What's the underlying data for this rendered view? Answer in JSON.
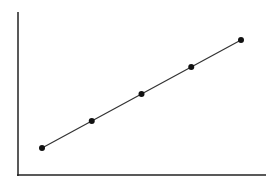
{
  "chart_data": {
    "type": "line",
    "title": "",
    "xlabel": "",
    "ylabel": "",
    "x": [
      1,
      2,
      3,
      4,
      5
    ],
    "series": [
      {
        "name": "",
        "values": [
          1,
          2,
          3,
          4,
          5
        ]
      }
    ],
    "grid": false,
    "legend": "none",
    "colors": {
      "line": "#333333",
      "marker": "#111111",
      "axis": "#222222"
    }
  }
}
